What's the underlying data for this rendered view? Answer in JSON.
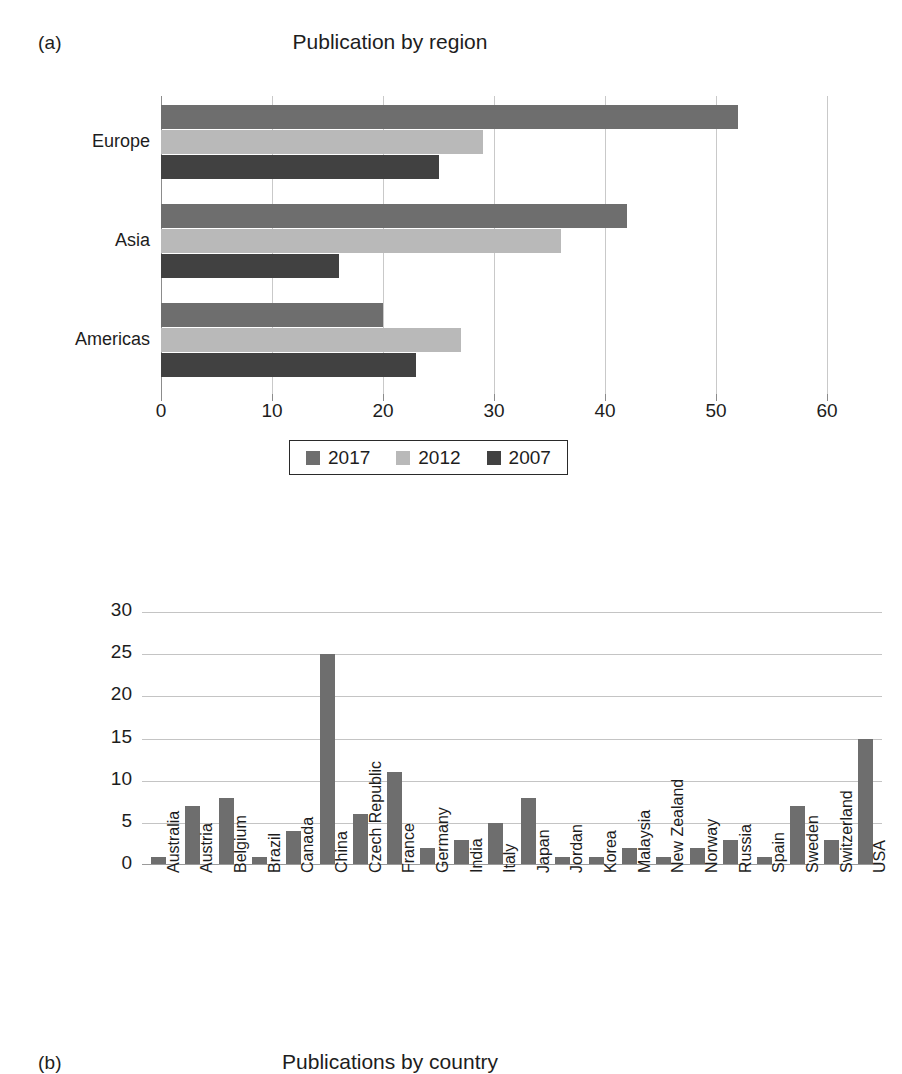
{
  "figure": {
    "panel_a_tag": "(a)",
    "panel_b_tag": "(b)"
  },
  "chart_data": [
    {
      "type": "bar",
      "orientation": "horizontal",
      "title": "Publication by region",
      "xlabel": "",
      "ylabel": "",
      "xlim": [
        0,
        60
      ],
      "xticks": [
        0,
        10,
        20,
        30,
        40,
        50,
        60
      ],
      "xtick_labels": [
        "0",
        "10",
        "20",
        "30",
        "40",
        "50",
        "60"
      ],
      "grid": "vertical",
      "categories": [
        "Europe",
        "Asia",
        "Americas"
      ],
      "legend_position": "below",
      "series": [
        {
          "name": "2017",
          "color": "#6e6e6e",
          "values": [
            52,
            42,
            20
          ]
        },
        {
          "name": "2012",
          "color": "#b9b9b9",
          "values": [
            29,
            36,
            27
          ]
        },
        {
          "name": "2007",
          "color": "#414141",
          "values": [
            25,
            16,
            23
          ]
        }
      ]
    },
    {
      "type": "bar",
      "orientation": "vertical",
      "title": "Publications by country",
      "xlabel": "",
      "ylabel": "",
      "ylim": [
        0,
        30
      ],
      "yticks": [
        0,
        5,
        10,
        15,
        20,
        25,
        30
      ],
      "ytick_labels": [
        "0",
        "5",
        "10",
        "15",
        "20",
        "25",
        "30"
      ],
      "grid": "horizontal",
      "bar_color": "#6e6e6e",
      "categories": [
        "Australia",
        "Austria",
        "Belgium",
        "Brazil",
        "Canada",
        "China",
        "Czech Republic",
        "France",
        "Germany",
        "India",
        "Italy",
        "Japan",
        "Jordan",
        "Korea",
        "Malaysia",
        "New Zealand",
        "Norway",
        "Russia",
        "Spain",
        "Sweden",
        "Switzerland",
        "USA"
      ],
      "values": [
        1,
        7,
        8,
        1,
        4,
        25,
        6,
        11,
        2,
        3,
        5,
        8,
        1,
        1,
        2,
        1,
        2,
        3,
        1,
        7,
        3,
        15
      ]
    }
  ]
}
